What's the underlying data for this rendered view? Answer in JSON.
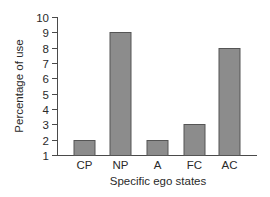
{
  "chart_data": {
    "type": "bar",
    "title": "",
    "xlabel": "Specific ego states",
    "ylabel": "Percentage of use",
    "categories": [
      "CP",
      "NP",
      "A",
      "FC",
      "AC"
    ],
    "values": [
      2,
      9,
      2,
      3,
      8
    ],
    "ylim": [
      1,
      10
    ],
    "yticks": [
      1,
      2,
      3,
      4,
      5,
      6,
      7,
      8,
      9,
      10
    ],
    "grid": false,
    "legend": null,
    "bar_color": "#8c8c8c",
    "bar_edge_color": "#555555"
  }
}
